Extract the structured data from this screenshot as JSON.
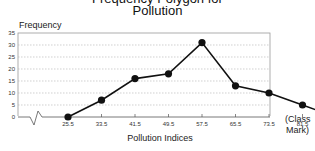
{
  "chart_data": {
    "type": "line",
    "title_partial": "Frequency Polygon for",
    "title": "Pollution",
    "ylabel": "Frequency",
    "xlabel": "Pollution Indices",
    "x_note": "(Class Mark)",
    "x": [
      25.5,
      33.5,
      41.5,
      49.5,
      57.5,
      65.5,
      73.5,
      81.5,
      89.5
    ],
    "x_labels": [
      "25.5",
      "33.5",
      "41.5",
      "49.5",
      "57.5",
      "65.5",
      "73.5",
      "81.5",
      "89.5"
    ],
    "series": [
      {
        "name": "Frequency",
        "values": [
          0,
          7,
          16,
          18,
          31,
          13,
          10,
          5,
          0
        ]
      }
    ],
    "y_ticks": [
      0,
      5,
      10,
      15,
      20,
      25,
      30,
      35
    ],
    "ylim": [
      0,
      35
    ],
    "grid": true,
    "axis_break": true
  },
  "labels": {
    "title": "Pollution",
    "title_partial": "Frequency Polygon for",
    "ylabel": "Frequency",
    "xlabel": "Pollution Indices",
    "x_note_1": "(Class",
    "x_note_2": "Mark)"
  }
}
